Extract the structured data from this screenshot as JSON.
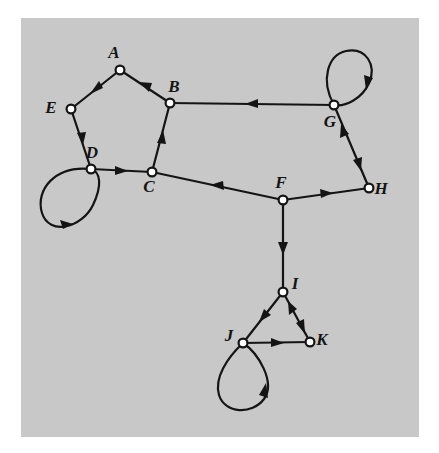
{
  "figure": {
    "background_color": "#c8c8c8",
    "page_color": "#ffffff",
    "ink_color": "#141414",
    "node_fill": "#ffffff",
    "paper": {
      "x": 21,
      "y": 18,
      "width": 398,
      "height": 419
    }
  },
  "graph": {
    "type": "directed-graph",
    "node_count": 11,
    "edge_count": 15,
    "nodes": [
      {
        "id": "A",
        "label": "A",
        "x": 120,
        "y": 70,
        "label_dx": -6,
        "label_dy": -12
      },
      {
        "id": "B",
        "label": "B",
        "x": 170,
        "y": 103,
        "label_dx": 4,
        "label_dy": -11
      },
      {
        "id": "C",
        "label": "C",
        "x": 152,
        "y": 172,
        "label_dx": -3,
        "label_dy": 20
      },
      {
        "id": "D",
        "label": "D",
        "x": 91,
        "y": 169,
        "label_dx": 1,
        "label_dy": -11
      },
      {
        "id": "E",
        "label": "E",
        "x": 71,
        "y": 109,
        "label_dx": -20,
        "label_dy": 4
      },
      {
        "id": "F",
        "label": "F",
        "x": 283,
        "y": 200,
        "label_dx": -2,
        "label_dy": -12
      },
      {
        "id": "G",
        "label": "G",
        "x": 334,
        "y": 105,
        "label_dx": -4,
        "label_dy": 22
      },
      {
        "id": "H",
        "label": "H",
        "x": 369,
        "y": 188,
        "label_dx": 10,
        "label_dy": 6
      },
      {
        "id": "I",
        "label": "I",
        "x": 283,
        "y": 292,
        "label_dx": 10,
        "label_dy": -3
      },
      {
        "id": "J",
        "label": "J",
        "x": 243,
        "y": 343,
        "label_dx": -16,
        "label_dy": -2
      },
      {
        "id": "K",
        "label": "K",
        "x": 310,
        "y": 342,
        "label_dx": 10,
        "label_dy": 3
      }
    ],
    "edges": [
      {
        "from": "A",
        "to": "E",
        "kind": "straight"
      },
      {
        "from": "B",
        "to": "A",
        "kind": "straight"
      },
      {
        "from": "E",
        "to": "D",
        "kind": "straight"
      },
      {
        "from": "D",
        "to": "C",
        "kind": "straight"
      },
      {
        "from": "C",
        "to": "B",
        "kind": "straight"
      },
      {
        "from": "G",
        "to": "B",
        "kind": "straight"
      },
      {
        "from": "F",
        "to": "C",
        "kind": "straight"
      },
      {
        "from": "F",
        "to": "H",
        "kind": "straight"
      },
      {
        "from": "H",
        "to": "G",
        "kind": "shared-line",
        "note": "same segment as G to H, arrowhead near G"
      },
      {
        "from": "G",
        "to": "H",
        "kind": "shared-line",
        "note": "same segment as H to G, arrowhead near H"
      },
      {
        "from": "F",
        "to": "I",
        "kind": "straight"
      },
      {
        "from": "I",
        "to": "J",
        "kind": "straight"
      },
      {
        "from": "J",
        "to": "K",
        "kind": "straight"
      },
      {
        "from": "K",
        "to": "I",
        "kind": "shared-line",
        "note": "same segment as I to K, arrowhead near I"
      },
      {
        "from": "I",
        "to": "K",
        "kind": "shared-line",
        "note": "same segment as K to I, arrowhead near K"
      }
    ],
    "self_loops": [
      {
        "node": "D",
        "direction": "down-left",
        "orientation": "clockwise"
      },
      {
        "node": "G",
        "direction": "up",
        "orientation": "clockwise"
      },
      {
        "node": "J",
        "direction": "down",
        "orientation": "counter-clockwise"
      }
    ]
  }
}
